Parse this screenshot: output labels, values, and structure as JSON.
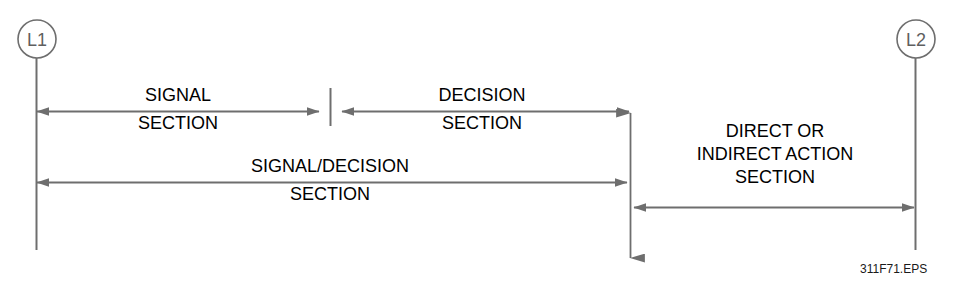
{
  "figure": {
    "file_reference": "311F71.EPS",
    "line_color": "#6e6e6e",
    "text_color": "#000000",
    "node_text_color": "#5f5f5f",
    "background_color": "#ffffff"
  },
  "nodes": [
    {
      "id": "L1",
      "label": "L1",
      "cx": 37,
      "cy": 39,
      "r": 19
    },
    {
      "id": "L2",
      "label": "L2",
      "cx": 916,
      "cy": 39,
      "r": 19
    }
  ],
  "dimensions": [
    {
      "id": "signal-section",
      "line1": "SIGNAL",
      "line2": "SECTION",
      "orientation": "horizontal",
      "x1": 35,
      "x2": 320,
      "y": 111,
      "label_center_x": 178,
      "label_top_y": 84
    },
    {
      "id": "decision-section",
      "line1": "DECISION",
      "line2": "SECTION",
      "orientation": "horizontal",
      "x1": 341,
      "x2": 628,
      "y": 111,
      "label_center_x": 482,
      "label_top_y": 84
    },
    {
      "id": "signal-decision-section",
      "line1": "SIGNAL/DECISION",
      "line2": "SECTION",
      "orientation": "horizontal",
      "x1": 35,
      "x2": 626,
      "y": 182,
      "label_center_x": 330,
      "label_top_y": 155
    },
    {
      "id": "direct-or-indirect-action-section",
      "line1": "DIRECT OR",
      "line2": "INDIRECT ACTION",
      "line3": "SECTION",
      "orientation": "horizontal",
      "x1": 634,
      "x2": 914,
      "y": 207,
      "label_center_x": 775,
      "label_top_y": 120
    },
    {
      "id": "section-boundary-extent",
      "orientation": "vertical",
      "x": 630,
      "y1": 112,
      "y2": 259
    }
  ],
  "extension_lines": [
    {
      "id": "left-extension-line",
      "x": 36,
      "y1": 58,
      "y2": 250
    },
    {
      "id": "right-extension-line",
      "x": 915,
      "y1": 58,
      "y2": 250
    },
    {
      "id": "mid-tick-line",
      "x": 330,
      "y1": 88,
      "y2": 126
    }
  ]
}
